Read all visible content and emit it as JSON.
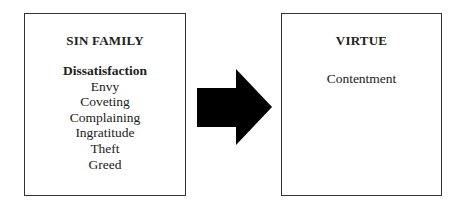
{
  "diagram": {
    "left_box": {
      "title": "SIN FAMILY",
      "items": [
        "Dissatisfaction",
        "Envy",
        "Coveting",
        "Complaining",
        "Ingratitude",
        "Theft",
        "Greed"
      ]
    },
    "arrow": {
      "direction": "right",
      "color": "#000000"
    },
    "right_box": {
      "title": "VIRTUE",
      "items": [
        "Contentment"
      ]
    }
  }
}
